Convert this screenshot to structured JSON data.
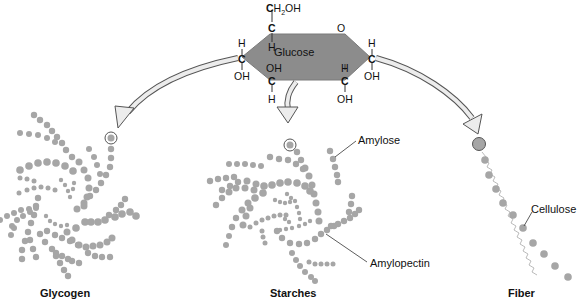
{
  "diagram": {
    "colors": {
      "hexagon_fill": "#8c8c8c",
      "dot": "#a6a6a6",
      "arrow_fill": "#ececec",
      "arrow_stroke": "#555555",
      "text": "#111111"
    },
    "glucose": {
      "label": "Glucose",
      "top_group": "CH",
      "top_group_sub": "2",
      "top_group_tail": "OH",
      "ring_oxygen": "O",
      "atoms": {
        "c5": "C",
        "c5_h": "H",
        "c4": "C",
        "c4_h": "H",
        "c4_oh": "OH",
        "c3": "C",
        "c3_oh": "OH",
        "c3_h": "H",
        "c2": "C",
        "c2_h": "H",
        "c2_oh": "OH",
        "c1": "C",
        "c1_h": "H",
        "c1_oh": "OH"
      }
    },
    "groups": [
      {
        "id": "glycogen",
        "label": "Glycogen"
      },
      {
        "id": "starches",
        "label": "Starches",
        "sublabels": [
          "Amylose",
          "Amylopectin"
        ]
      },
      {
        "id": "fiber",
        "label": "Fiber",
        "sublabels": [
          "Cellulose"
        ]
      }
    ]
  }
}
